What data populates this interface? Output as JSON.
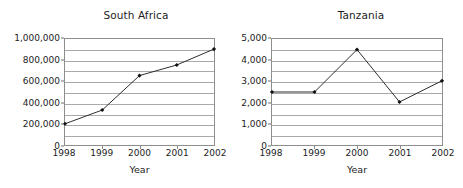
{
  "chart_data": [
    {
      "type": "line",
      "title": "South Africa",
      "xlabel": "Year",
      "ylabel": "",
      "categories": [
        "1998",
        "1999",
        "2000",
        "2001",
        "2002"
      ],
      "x": [
        1998,
        1999,
        2000,
        2001,
        2002
      ],
      "values": [
        200000,
        330000,
        655000,
        755000,
        905000
      ],
      "ylim": [
        0,
        1000000
      ],
      "xlim": [
        1998,
        2002
      ],
      "ytick_values": [
        0,
        200000,
        400000,
        600000,
        800000,
        1000000
      ],
      "ytick_labels": [
        "0",
        "200,000",
        "400,000",
        "600,000",
        "800,000",
        "1,000,000"
      ],
      "gridline_values": [
        0,
        100000,
        200000,
        300000,
        400000,
        500000,
        600000,
        700000,
        800000,
        900000,
        1000000
      ],
      "grid": true,
      "legend": "none",
      "marker": "diamond",
      "line_color": "#2b2b2b"
    },
    {
      "type": "line",
      "title": "Tanzania",
      "xlabel": "Year",
      "ylabel": "",
      "categories": [
        "1998",
        "1999",
        "2000",
        "2001",
        "2002"
      ],
      "x": [
        1998,
        1999,
        2000,
        2001,
        2002
      ],
      "values": [
        2500,
        2500,
        4500,
        2030,
        3030
      ],
      "ylim": [
        0,
        5000
      ],
      "xlim": [
        1998,
        2002
      ],
      "ytick_values": [
        0,
        1000,
        2000,
        3000,
        4000,
        5000
      ],
      "ytick_labels": [
        "0",
        "1,000",
        "2,000",
        "3,000",
        "4,000",
        "5,000"
      ],
      "gridline_values": [
        0,
        500,
        1000,
        1500,
        2000,
        2500,
        3000,
        3500,
        4000,
        4500,
        5000
      ],
      "grid": true,
      "legend": "none",
      "marker": "diamond",
      "line_color": "#2b2b2b"
    }
  ]
}
